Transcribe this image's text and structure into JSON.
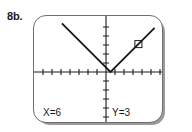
{
  "problem": {
    "label": "8b."
  },
  "calculator": {
    "screen_bg": "#ffffff",
    "bezel_color": "#6d6d6d",
    "shadow_color": "#9a9a9a",
    "trace": {
      "x_readout": "X=6",
      "y_readout": "Y=3"
    }
  },
  "chart_data": {
    "type": "line",
    "title": "",
    "subtitle": "",
    "xlabel": "",
    "ylabel": "",
    "grid": false,
    "legend": null,
    "axis_color": "#1a1a1a",
    "curve_color": "#1a1a1a",
    "xlim": [
      -8,
      6
    ],
    "ylim": [
      -5.5,
      5.5
    ],
    "x_tick_step": 1,
    "y_tick_step": 1,
    "origin_px": {
      "x": 72,
      "y": 56
    },
    "px_per_unit": {
      "x": 9,
      "y": 9
    },
    "series": [
      {
        "name": "absolute-value-curve",
        "kind": "piecewise-linear",
        "points": [
          {
            "x": -4.9,
            "y": 5.4
          },
          {
            "x": 0.5,
            "y": 0.0
          },
          {
            "x": 5.4,
            "y": 4.9
          }
        ],
        "vertex": {
          "x": 0.5,
          "y": 0
        },
        "left_slope": -1,
        "right_slope": 1
      }
    ],
    "annotations": [
      {
        "name": "trace-cursor",
        "shape": "square-outline",
        "x": 3.6,
        "y": 3.1,
        "size_px": 7
      }
    ]
  }
}
